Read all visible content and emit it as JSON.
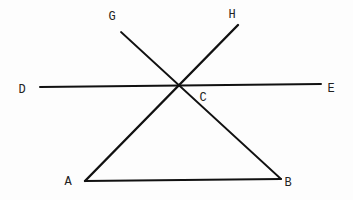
{
  "diagram": {
    "type": "geometry",
    "points": {
      "A": {
        "label": "A",
        "x": 85,
        "y": 181,
        "label_x": 68,
        "label_y": 182
      },
      "B": {
        "label": "B",
        "x": 281,
        "y": 179,
        "label_x": 288,
        "label_y": 183
      },
      "C": {
        "label": "C",
        "x": 179,
        "y": 86,
        "label_x": 203,
        "label_y": 98
      },
      "D": {
        "label": "D",
        "x": 40,
        "y": 87,
        "label_x": 22,
        "label_y": 90
      },
      "E": {
        "label": "E",
        "x": 321,
        "y": 84,
        "label_x": 331,
        "label_y": 89
      },
      "G": {
        "label": "G",
        "x": 121,
        "y": 32,
        "label_x": 112,
        "label_y": 17
      },
      "H": {
        "label": "H",
        "x": 238,
        "y": 25,
        "label_x": 232,
        "label_y": 15
      }
    },
    "segments": [
      {
        "name": "segment-de",
        "from": "D",
        "to": "E",
        "width": 2
      },
      {
        "name": "segment-ah",
        "from": "A",
        "to": "H",
        "width": 2.4
      },
      {
        "name": "segment-gb",
        "from": "G",
        "to": "B",
        "width": 1.8
      },
      {
        "name": "segment-ab",
        "from": "A",
        "to": "B",
        "width": 2
      }
    ]
  }
}
